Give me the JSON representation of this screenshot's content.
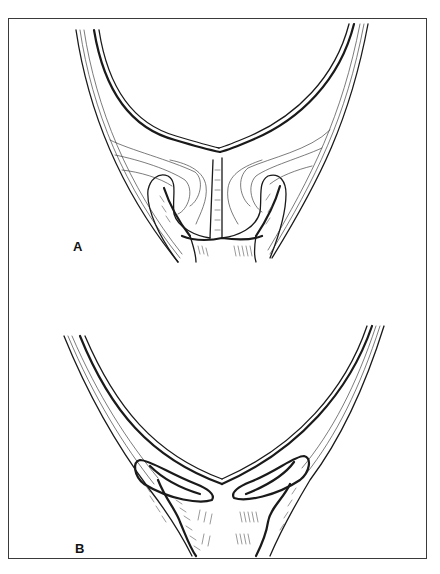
{
  "figure": {
    "panels": [
      {
        "id": "A",
        "label": "A"
      },
      {
        "id": "B",
        "label": "B"
      }
    ],
    "colors": {
      "ink": "#1a1a1a",
      "background": "#ffffff",
      "frame": "#3a3a3a"
    }
  }
}
